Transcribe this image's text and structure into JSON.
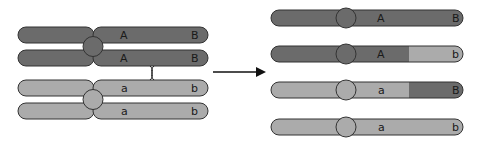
{
  "colors": {
    "dark": "#6b6b6b",
    "light": "#ababab",
    "outline": "#333333",
    "background": "#ffffff"
  },
  "before": {
    "title": "Homologous chromosomes during crossing over",
    "chromatids": [
      {
        "tone": "dark",
        "gene1": "A",
        "gene2": "B"
      },
      {
        "tone": "dark",
        "gene1": "A",
        "gene2": "B"
      },
      {
        "tone": "light",
        "gene1": "a",
        "gene2": "b"
      },
      {
        "tone": "light",
        "gene1": "a",
        "gene2": "b"
      }
    ],
    "crossover": "chiasma between chromatid 2 and 3"
  },
  "arrow": {
    "direction": "right"
  },
  "after": {
    "title": "Resulting recombinant chromatids",
    "chromatids": [
      {
        "tone": "dark",
        "gene1": "A",
        "gene2": "B",
        "segment2_tone": "dark"
      },
      {
        "tone": "dark",
        "gene1": "A",
        "gene2": "b",
        "segment2_tone": "light"
      },
      {
        "tone": "light",
        "gene1": "a",
        "gene2": "B",
        "segment2_tone": "dark"
      },
      {
        "tone": "light",
        "gene1": "a",
        "gene2": "b",
        "segment2_tone": "light"
      }
    ]
  }
}
